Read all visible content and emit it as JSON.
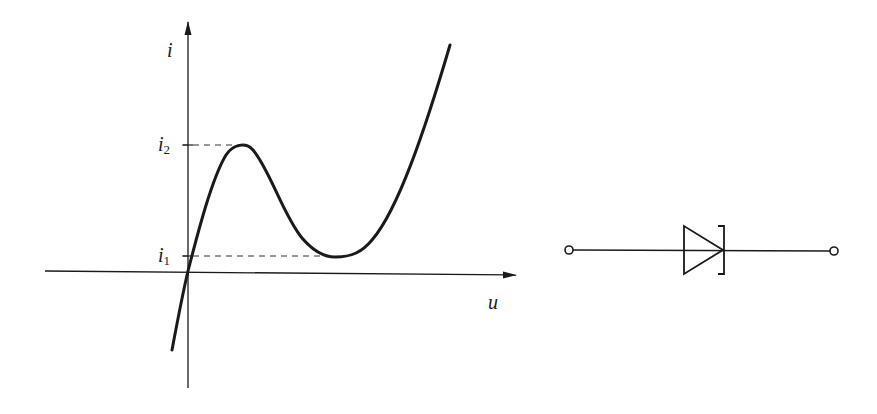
{
  "figure": {
    "left_panel": "Current-voltage characteristic (N-shaped curve)",
    "right_panel": "Tunnel diode circuit symbol"
  },
  "axes": {
    "y_label": "i",
    "x_label": "u",
    "levels": [
      {
        "name": "i2",
        "symbol": "i",
        "subscript": "2",
        "meaning": "peak current"
      },
      {
        "name": "i1",
        "symbol": "i",
        "subscript": "1",
        "meaning": "valley current"
      }
    ]
  },
  "colors": {
    "stroke": "#1a1a1a",
    "background": "#ffffff"
  }
}
